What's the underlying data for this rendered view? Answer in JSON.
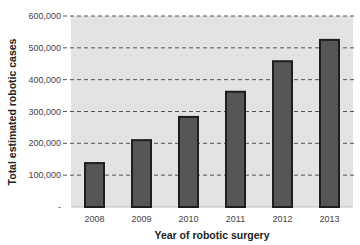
{
  "chart_data": {
    "type": "bar",
    "title": "",
    "xlabel": "Year of robotic surgery",
    "ylabel": "Total estimated robotic cases",
    "categories": [
      "2008",
      "2009",
      "2010",
      "2011",
      "2012",
      "2013"
    ],
    "values": [
      138000,
      210000,
      283000,
      362000,
      458000,
      525000
    ],
    "ylim": [
      0,
      600000
    ],
    "yticks": [
      0,
      100000,
      200000,
      300000,
      400000,
      500000,
      600000
    ],
    "ytick_labels": [
      "-",
      "100,000",
      "200,000",
      "300,000",
      "400,000",
      "500,000",
      "600,000"
    ],
    "grid": true,
    "legend": null,
    "colors": {
      "bar_fill": "#565656",
      "bar_border": "#1e1e1e",
      "plot_background": "#e3e3e3",
      "gridline": "#555555"
    }
  }
}
